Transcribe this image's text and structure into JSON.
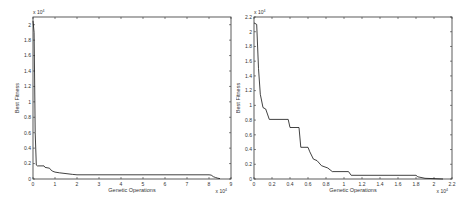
{
  "chart_data": [
    {
      "type": "line",
      "title": "",
      "xlabel": "Genetic Operations",
      "ylabel": "Best Fitness",
      "x_multiplier_label": "x 10",
      "x_multiplier_exp": "4",
      "y_multiplier_label": "x 10",
      "y_multiplier_exp": "4",
      "xlim": [
        0,
        9
      ],
      "ylim": [
        0,
        2.1
      ],
      "xticks": [
        "0",
        "1",
        "2",
        "3",
        "4",
        "5",
        "6",
        "7",
        "8",
        "9"
      ],
      "yticks": [
        "0",
        "0.2",
        "0.4",
        "0.6",
        "0.8",
        "1",
        "1.2",
        "1.4",
        "1.6",
        "1.8",
        "2"
      ],
      "grid": false,
      "series": [
        {
          "name": "best-fitness",
          "x": [
            0,
            0.05,
            0.1,
            0.15,
            0.2,
            0.5,
            0.55,
            0.75,
            0.8,
            0.9,
            1.0,
            1.2,
            1.5,
            1.8,
            2.0,
            4.0,
            6.0,
            8.0,
            8.1,
            8.2,
            8.3,
            8.4,
            8.5
          ],
          "y": [
            2.05,
            1.9,
            0.6,
            0.18,
            0.17,
            0.17,
            0.15,
            0.14,
            0.12,
            0.1,
            0.09,
            0.08,
            0.07,
            0.06,
            0.055,
            0.055,
            0.055,
            0.055,
            0.05,
            0.03,
            0.02,
            0.01,
            0.005
          ]
        }
      ]
    },
    {
      "type": "line",
      "title": "",
      "xlabel": "Genetic Operations",
      "ylabel": "Best Fitness",
      "x_multiplier_label": "x 10",
      "x_multiplier_exp": "4",
      "y_multiplier_label": "x 10",
      "y_multiplier_exp": "4",
      "xlim": [
        0,
        2.2
      ],
      "ylim": [
        0,
        2.2
      ],
      "xticks": [
        "0",
        "0.2",
        "0.4",
        "0.6",
        "0.8",
        "1",
        "1.2",
        "1.4",
        "1.6",
        "1.8",
        "2",
        "2.2"
      ],
      "yticks": [
        "0",
        "0.2",
        "0.4",
        "0.6",
        "0.8",
        "1",
        "1.2",
        "1.4",
        "1.6",
        "1.8",
        "2",
        "2.2"
      ],
      "grid": false,
      "series": [
        {
          "name": "best-fitness",
          "x": [
            0,
            0.03,
            0.05,
            0.07,
            0.1,
            0.13,
            0.17,
            0.38,
            0.4,
            0.5,
            0.52,
            0.6,
            0.62,
            0.66,
            0.7,
            0.75,
            0.82,
            0.87,
            1.05,
            1.08,
            1.8,
            1.82,
            1.9,
            2.1
          ],
          "y": [
            2.12,
            2.1,
            1.5,
            1.15,
            0.97,
            0.95,
            0.81,
            0.81,
            0.7,
            0.7,
            0.43,
            0.43,
            0.37,
            0.27,
            0.25,
            0.18,
            0.15,
            0.1,
            0.1,
            0.05,
            0.05,
            0.03,
            0.01,
            0.0
          ]
        }
      ]
    }
  ]
}
